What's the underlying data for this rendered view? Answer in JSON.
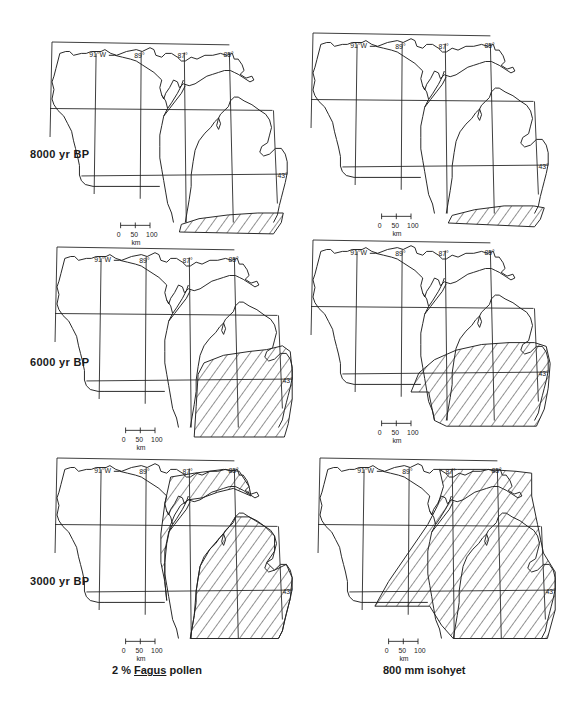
{
  "figure": {
    "rows": [
      {
        "label": "8000 yr BP"
      },
      {
        "label": "6000 yr BP"
      },
      {
        "label": "3000 yr BP"
      }
    ],
    "columns": [
      {
        "caption_prefix": "2 % ",
        "caption_genus": "Fagus",
        "caption_suffix": " pollen"
      },
      {
        "caption": "800 mm isohyet"
      }
    ],
    "map_labels": {
      "lon_91": "91°W",
      "lon_89": "89°",
      "lon_87": "87°",
      "lon_85": "85°",
      "lat_43": "43°"
    },
    "scale_bar": {
      "ticks": [
        "0",
        "50",
        "100"
      ],
      "unit": "km"
    }
  }
}
